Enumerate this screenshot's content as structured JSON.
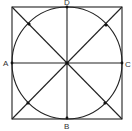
{
  "figure": {
    "labels": {
      "left": "A",
      "bottom": "B",
      "right": "C",
      "top": "D"
    },
    "colors": {
      "stroke": "#222222",
      "background": "#ffffff"
    }
  }
}
